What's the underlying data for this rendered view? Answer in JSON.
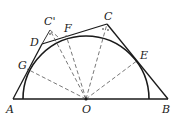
{
  "diagram": {
    "type": "geometry",
    "points": {
      "A": {
        "label": "A",
        "x": 13,
        "y": 99
      },
      "O": {
        "label": "O",
        "x": 86,
        "y": 99
      },
      "B": {
        "label": "B",
        "x": 168,
        "y": 99
      },
      "C": {
        "label": "C",
        "x": 107,
        "y": 24
      },
      "C_prime": {
        "label": "C'",
        "x": 50,
        "y": 30
      },
      "D": {
        "label": "D",
        "x": 42,
        "y": 44
      },
      "F": {
        "label": "F",
        "x": 66,
        "y": 35
      },
      "E": {
        "label": "E",
        "x": 138,
        "y": 60
      },
      "G": {
        "label": "G",
        "x": 27,
        "y": 69
      }
    },
    "semicircle": {
      "center": "O",
      "radius": 63
    },
    "solid_segments": [
      "A-B",
      "A-D",
      "D-C",
      "C-B",
      "D-C'"
    ],
    "dashed_segments": [
      "O-G",
      "O-F",
      "O-C'",
      "O-C",
      "O-E",
      "C'-F"
    ],
    "colors": {
      "stroke": "#1a1a1a",
      "dashed": "#555555",
      "background": "#ffffff"
    }
  }
}
